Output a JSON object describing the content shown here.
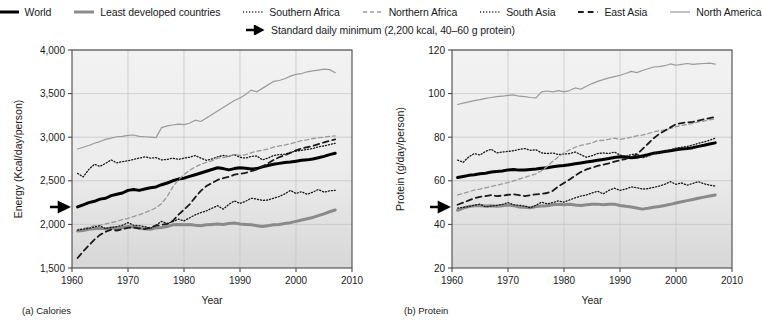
{
  "legend": {
    "items": [
      {
        "label": "World",
        "style": "solid",
        "width": 3.0,
        "color": "#000000",
        "name": "world"
      },
      {
        "label": "Least developed countries",
        "style": "solid",
        "width": 3.0,
        "color": "#8a8a8a",
        "name": "least-developed-countries"
      },
      {
        "label": "Southern Africa",
        "style": "dotted",
        "width": 1.3,
        "color": "#1a1a1a",
        "name": "southern-africa"
      },
      {
        "label": "Northern Africa",
        "style": "dashed",
        "width": 1.3,
        "color": "#9a9a9a",
        "name": "northern-africa"
      },
      {
        "label": "South Asia",
        "style": "dotted",
        "width": 1.3,
        "color": "#1a1a1a",
        "name": "south-asia"
      },
      {
        "label": "East Asia",
        "style": "dashed",
        "width": 1.8,
        "color": "#1a1a1a",
        "name": "east-asia"
      },
      {
        "label": "North America",
        "style": "solid",
        "width": 1.2,
        "color": "#9a9a9a",
        "name": "north-america"
      }
    ],
    "marker_note": "Standard daily minimum (2,200 kcal, 40–60 g protein)"
  },
  "captions": {
    "a": "(a) Calories",
    "b": "(b) Protein"
  },
  "chart_data": [
    {
      "id": "calories",
      "type": "line",
      "title": "(a) Calories",
      "xlabel": "Year",
      "ylabel": "Energy (Kcal/day/person)",
      "xlim": [
        1960,
        2010
      ],
      "ylim": [
        1500,
        4000
      ],
      "xticks": [
        "1960",
        "1970",
        "1980",
        "1990",
        "2000",
        "2010"
      ],
      "yticks": [
        "1,500",
        "2,000",
        "2,500",
        "3,000",
        "3,500",
        "4,000"
      ],
      "grid": true,
      "legend_position": "top",
      "marker": {
        "label": "Standard daily minimum",
        "value": 2200
      },
      "x": [
        1961,
        1962,
        1963,
        1964,
        1965,
        1966,
        1967,
        1968,
        1969,
        1970,
        1971,
        1972,
        1973,
        1974,
        1975,
        1976,
        1977,
        1978,
        1979,
        1980,
        1981,
        1982,
        1983,
        1984,
        1985,
        1986,
        1987,
        1988,
        1989,
        1990,
        1991,
        1992,
        1993,
        1994,
        1995,
        1996,
        1997,
        1998,
        1999,
        2000,
        2001,
        2002,
        2003,
        2004,
        2005,
        2006,
        2007
      ],
      "series": [
        {
          "name": "World",
          "style": "solid",
          "width": 3.0,
          "color": "#000000",
          "values": [
            2200,
            2225,
            2250,
            2265,
            2290,
            2300,
            2330,
            2345,
            2360,
            2390,
            2400,
            2390,
            2405,
            2420,
            2430,
            2455,
            2475,
            2500,
            2520,
            2530,
            2550,
            2570,
            2590,
            2610,
            2630,
            2650,
            2640,
            2625,
            2640,
            2650,
            2645,
            2635,
            2640,
            2660,
            2675,
            2690,
            2700,
            2710,
            2715,
            2725,
            2735,
            2740,
            2750,
            2765,
            2780,
            2800,
            2815
          ]
        },
        {
          "name": "Least developed countries",
          "style": "solid",
          "width": 3.0,
          "color": "#8a8a8a",
          "values": [
            1925,
            1930,
            1945,
            1950,
            1955,
            1950,
            1960,
            1955,
            1965,
            1975,
            1970,
            1955,
            1950,
            1945,
            1960,
            1965,
            1975,
            1995,
            2000,
            1995,
            2000,
            1990,
            1985,
            1995,
            2000,
            2005,
            2000,
            2010,
            2015,
            2005,
            2000,
            1995,
            1985,
            1975,
            1985,
            1995,
            2000,
            2010,
            2020,
            2035,
            2050,
            2065,
            2080,
            2100,
            2120,
            2145,
            2165
          ]
        },
        {
          "name": "Southern Africa",
          "style": "dotted",
          "width": 1.3,
          "color": "#1a1a1a",
          "values": [
            2585,
            2545,
            2630,
            2690,
            2665,
            2700,
            2740,
            2705,
            2720,
            2730,
            2745,
            2760,
            2775,
            2760,
            2765,
            2740,
            2745,
            2760,
            2745,
            2760,
            2770,
            2790,
            2760,
            2735,
            2750,
            2775,
            2790,
            2780,
            2800,
            2770,
            2760,
            2780,
            2785,
            2740,
            2760,
            2790,
            2800,
            2805,
            2825,
            2840,
            2850,
            2860,
            2870,
            2890,
            2900,
            2915,
            2930
          ]
        },
        {
          "name": "Northern Africa",
          "style": "dashed",
          "width": 1.3,
          "color": "#9a9a9a",
          "values": [
            1940,
            1955,
            1970,
            1985,
            1990,
            2005,
            2020,
            2035,
            2055,
            2070,
            2090,
            2110,
            2135,
            2160,
            2190,
            2240,
            2320,
            2430,
            2510,
            2570,
            2620,
            2660,
            2690,
            2710,
            2730,
            2760,
            2765,
            2780,
            2800,
            2790,
            2800,
            2820,
            2840,
            2850,
            2865,
            2885,
            2900,
            2910,
            2925,
            2945,
            2960,
            2970,
            2985,
            2995,
            3000,
            3010,
            3015
          ]
        },
        {
          "name": "South Asia",
          "style": "dotted",
          "width": 1.3,
          "color": "#1a1a1a",
          "values": [
            1935,
            1945,
            1955,
            1970,
            1985,
            1950,
            1965,
            1975,
            1990,
            2020,
            1990,
            1985,
            1975,
            1955,
            1990,
            2035,
            2010,
            2030,
            2060,
            2040,
            2075,
            2110,
            2135,
            2155,
            2185,
            2215,
            2175,
            2230,
            2270,
            2240,
            2265,
            2300,
            2290,
            2275,
            2280,
            2300,
            2320,
            2350,
            2390,
            2355,
            2375,
            2345,
            2370,
            2400,
            2370,
            2385,
            2390
          ]
        },
        {
          "name": "East Asia",
          "style": "dashed",
          "width": 1.8,
          "color": "#1a1a1a",
          "values": [
            1615,
            1690,
            1760,
            1825,
            1880,
            1915,
            1940,
            1930,
            1945,
            1960,
            1965,
            1955,
            1945,
            1965,
            1985,
            1995,
            2005,
            2040,
            2110,
            2170,
            2230,
            2310,
            2385,
            2440,
            2475,
            2510,
            2530,
            2545,
            2570,
            2580,
            2590,
            2610,
            2630,
            2665,
            2700,
            2740,
            2770,
            2795,
            2820,
            2850,
            2870,
            2885,
            2900,
            2920,
            2940,
            2960,
            2975
          ]
        },
        {
          "name": "North America",
          "style": "solid",
          "width": 1.2,
          "color": "#9a9a9a",
          "values": [
            2865,
            2885,
            2905,
            2930,
            2950,
            2975,
            2990,
            3005,
            3010,
            3020,
            3025,
            3010,
            3005,
            3000,
            2995,
            3110,
            3130,
            3140,
            3150,
            3145,
            3160,
            3195,
            3180,
            3220,
            3260,
            3300,
            3340,
            3380,
            3420,
            3450,
            3490,
            3540,
            3520,
            3560,
            3600,
            3640,
            3650,
            3670,
            3700,
            3720,
            3730,
            3750,
            3760,
            3770,
            3780,
            3775,
            3740
          ]
        }
      ]
    },
    {
      "id": "protein",
      "type": "line",
      "title": "(b) Protein",
      "xlabel": "Year",
      "ylabel": "Protein (g/day/person)",
      "xlim": [
        1960,
        2010
      ],
      "ylim": [
        20,
        120
      ],
      "xticks": [
        "1960",
        "1970",
        "1980",
        "1990",
        "2000",
        "2010"
      ],
      "yticks": [
        "20",
        "40",
        "60",
        "80",
        "100",
        "120"
      ],
      "grid": true,
      "legend_position": "top",
      "marker": {
        "label": "Standard daily minimum",
        "value": 48
      },
      "x": [
        1961,
        1962,
        1963,
        1964,
        1965,
        1966,
        1967,
        1968,
        1969,
        1970,
        1971,
        1972,
        1973,
        1974,
        1975,
        1976,
        1977,
        1978,
        1979,
        1980,
        1981,
        1982,
        1983,
        1984,
        1985,
        1986,
        1987,
        1988,
        1989,
        1990,
        1991,
        1992,
        1993,
        1994,
        1995,
        1996,
        1997,
        1998,
        1999,
        2000,
        2001,
        2002,
        2003,
        2004,
        2005,
        2006,
        2007
      ],
      "series": [
        {
          "name": "World",
          "style": "solid",
          "width": 3.0,
          "color": "#000000",
          "values": [
            61.5,
            62.0,
            62.5,
            62.8,
            63.2,
            63.5,
            64.0,
            64.3,
            64.5,
            65.0,
            65.2,
            64.9,
            65.0,
            65.2,
            65.4,
            65.8,
            66.0,
            66.4,
            66.8,
            67.0,
            67.4,
            67.8,
            68.2,
            68.6,
            69.0,
            69.4,
            69.8,
            70.2,
            70.7,
            71.0,
            70.9,
            70.6,
            70.8,
            71.4,
            72.0,
            72.6,
            73.0,
            73.4,
            73.8,
            74.2,
            74.6,
            74.8,
            75.2,
            75.8,
            76.3,
            76.9,
            77.4
          ]
        },
        {
          "name": "Least developed countries",
          "style": "solid",
          "width": 3.0,
          "color": "#8a8a8a",
          "values": [
            46.5,
            47.5,
            48.2,
            48.5,
            48.6,
            48.4,
            48.6,
            48.3,
            48.6,
            48.9,
            48.6,
            48.0,
            47.9,
            47.6,
            48.2,
            48.4,
            48.6,
            49.0,
            49.2,
            49.0,
            49.2,
            48.9,
            48.7,
            49.0,
            49.2,
            49.3,
            49.0,
            49.2,
            49.3,
            48.7,
            48.3,
            48.0,
            47.5,
            47.0,
            47.4,
            47.9,
            48.2,
            48.7,
            49.2,
            49.8,
            50.4,
            50.9,
            51.4,
            52.0,
            52.5,
            53.0,
            53.5
          ]
        },
        {
          "name": "Southern Africa",
          "style": "dotted",
          "width": 1.3,
          "color": "#1a1a1a",
          "values": [
            69.5,
            68.5,
            71.0,
            72.5,
            71.8,
            73.5,
            74.5,
            72.8,
            73.2,
            73.5,
            73.8,
            74.4,
            74.8,
            74.0,
            74.2,
            72.8,
            72.5,
            72.8,
            72.0,
            72.3,
            72.5,
            73.2,
            72.0,
            70.8,
            71.5,
            72.5,
            72.8,
            72.5,
            73.2,
            71.8,
            71.2,
            72.0,
            72.4,
            70.5,
            71.2,
            72.5,
            73.0,
            73.4,
            74.2,
            75.0,
            75.4,
            75.8,
            76.4,
            77.2,
            77.8,
            78.6,
            79.5
          ]
        },
        {
          "name": "Northern Africa",
          "style": "dashed",
          "width": 1.3,
          "color": "#9a9a9a",
          "values": [
            53.5,
            54.2,
            55.0,
            55.8,
            56.2,
            56.8,
            57.4,
            58.0,
            58.6,
            59.2,
            60.0,
            60.8,
            61.6,
            62.4,
            63.2,
            64.6,
            66.6,
            69.0,
            71.0,
            72.8,
            74.2,
            75.4,
            76.2,
            76.8,
            77.4,
            78.4,
            78.6,
            79.0,
            79.6,
            79.0,
            79.4,
            80.0,
            80.6,
            81.0,
            81.6,
            82.4,
            83.0,
            83.4,
            84.0,
            84.8,
            85.4,
            85.8,
            86.4,
            87.0,
            87.4,
            88.0,
            88.4
          ]
        },
        {
          "name": "South Asia",
          "style": "dotted",
          "width": 1.3,
          "color": "#1a1a1a",
          "values": [
            47.5,
            47.8,
            48.2,
            48.8,
            49.3,
            48.0,
            48.4,
            48.7,
            49.2,
            50.0,
            49.0,
            48.8,
            48.4,
            47.6,
            48.8,
            50.2,
            49.4,
            50.0,
            50.8,
            50.2,
            51.2,
            52.2,
            53.0,
            53.5,
            54.4,
            55.2,
            54.0,
            55.6,
            56.6,
            55.6,
            56.2,
            57.2,
            56.8,
            56.2,
            56.4,
            57.0,
            57.6,
            58.4,
            59.6,
            58.4,
            59.0,
            58.0,
            58.8,
            59.6,
            58.6,
            58.0,
            57.6
          ]
        },
        {
          "name": "East Asia",
          "style": "dashed",
          "width": 1.8,
          "color": "#1a1a1a",
          "values": [
            49.0,
            50.0,
            51.0,
            52.0,
            52.6,
            53.0,
            53.4,
            53.0,
            53.2,
            53.6,
            53.8,
            53.4,
            53.0,
            53.4,
            53.8,
            54.0,
            54.4,
            55.4,
            57.4,
            59.0,
            60.6,
            62.4,
            64.0,
            65.2,
            66.0,
            66.8,
            67.4,
            68.0,
            68.8,
            69.4,
            70.0,
            70.8,
            72.0,
            74.5,
            77.0,
            79.5,
            81.5,
            83.0,
            84.5,
            86.0,
            86.5,
            86.8,
            87.0,
            87.6,
            88.2,
            88.8,
            89.2
          ]
        },
        {
          "name": "North America",
          "style": "solid",
          "width": 1.2,
          "color": "#9a9a9a",
          "values": [
            95.0,
            95.6,
            96.2,
            96.8,
            97.2,
            97.8,
            98.2,
            98.6,
            98.8,
            99.2,
            99.4,
            98.8,
            98.6,
            98.2,
            98.0,
            100.8,
            101.2,
            100.8,
            101.4,
            100.8,
            101.4,
            102.6,
            102.0,
            103.4,
            104.6,
            105.6,
            106.4,
            107.2,
            107.8,
            108.4,
            109.2,
            110.2,
            109.6,
            110.6,
            111.4,
            112.2,
            112.4,
            112.8,
            113.6,
            113.0,
            113.4,
            113.8,
            113.4,
            113.6,
            113.8,
            114.0,
            113.5
          ]
        }
      ]
    }
  ]
}
